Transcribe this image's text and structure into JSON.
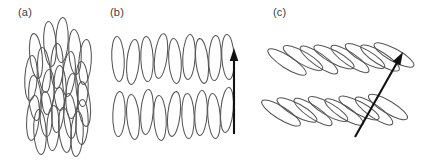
{
  "figure": {
    "background_color": "#ffffff",
    "particle_stroke_color": "#555555",
    "arrow_color": "#111111",
    "label_color": "#3d3d3d",
    "width": 423,
    "height": 161
  },
  "panels": [
    {
      "id": "panel-a",
      "label": "(a)",
      "label_x": 18,
      "label_y": 16,
      "phase": "nematic",
      "has_director_arrow": false,
      "particle_count": 24,
      "description": "Randomly positioned elongated particles with roughly aligned long axes and no layer ordering"
    },
    {
      "id": "panel-b",
      "label": "(b)",
      "label_x": 110,
      "label_y": 16,
      "phase": "smectic-A",
      "has_director_arrow": true,
      "particle_count": 18,
      "description": "Two layers of elongated particles with long axes parallel to the layer normal"
    },
    {
      "id": "panel-c",
      "label": "(c)",
      "label_x": 273,
      "label_y": 16,
      "phase": "smectic-C",
      "has_director_arrow": true,
      "particle_count": 16,
      "description": "Two layers of elongated particles with long axes tilted with respect to the layer normal"
    }
  ],
  "chart_data": {
    "type": "diagram",
    "title": "",
    "xlabel": "",
    "ylabel": "",
    "ellipse_rx": 6.2,
    "ellipse_ry": 22.5,
    "panel_a_particles": [
      {
        "cx": 36,
        "cy": 56,
        "rot": -6
      },
      {
        "cx": 50,
        "cy": 44,
        "rot": -4
      },
      {
        "cx": 62,
        "cy": 40,
        "rot": 2
      },
      {
        "cx": 75,
        "cy": 52,
        "rot": -3
      },
      {
        "cx": 85,
        "cy": 62,
        "rot": 4
      },
      {
        "cx": 31,
        "cy": 78,
        "rot": 3
      },
      {
        "cx": 44,
        "cy": 70,
        "rot": -5
      },
      {
        "cx": 57,
        "cy": 66,
        "rot": 1
      },
      {
        "cx": 69,
        "cy": 74,
        "rot": 5
      },
      {
        "cx": 82,
        "cy": 84,
        "rot": -2
      },
      {
        "cx": 35,
        "cy": 98,
        "rot": -4
      },
      {
        "cx": 48,
        "cy": 92,
        "rot": 3
      },
      {
        "cx": 60,
        "cy": 88,
        "rot": -1
      },
      {
        "cx": 72,
        "cy": 96,
        "rot": 2
      },
      {
        "cx": 84,
        "cy": 104,
        "rot": -6
      },
      {
        "cx": 33,
        "cy": 118,
        "rot": 5
      },
      {
        "cx": 46,
        "cy": 114,
        "rot": -2
      },
      {
        "cx": 58,
        "cy": 110,
        "rot": 4
      },
      {
        "cx": 70,
        "cy": 116,
        "rot": -4
      },
      {
        "cx": 82,
        "cy": 122,
        "rot": 1
      },
      {
        "cx": 40,
        "cy": 132,
        "rot": -3
      },
      {
        "cx": 53,
        "cy": 128,
        "rot": 2
      },
      {
        "cx": 65,
        "cy": 130,
        "rot": -5
      },
      {
        "cx": 77,
        "cy": 134,
        "rot": 3
      }
    ],
    "panel_b_row1": [
      {
        "cx": 118,
        "cy": 59,
        "rot": -3
      },
      {
        "cx": 133,
        "cy": 62,
        "rot": 5
      },
      {
        "cx": 147,
        "cy": 59,
        "rot": -2
      },
      {
        "cx": 161,
        "cy": 56,
        "rot": 7
      },
      {
        "cx": 175,
        "cy": 61,
        "rot": -4
      },
      {
        "cx": 189,
        "cy": 57,
        "rot": 3
      },
      {
        "cx": 202,
        "cy": 61,
        "rot": -6
      },
      {
        "cx": 215,
        "cy": 58,
        "rot": 2
      },
      {
        "cx": 228,
        "cy": 57,
        "rot": -3
      }
    ],
    "panel_b_row2": [
      {
        "cx": 119,
        "cy": 114,
        "rot": 2
      },
      {
        "cx": 133,
        "cy": 117,
        "rot": -5
      },
      {
        "cx": 147,
        "cy": 112,
        "rot": 4
      },
      {
        "cx": 160,
        "cy": 118,
        "rot": -3
      },
      {
        "cx": 174,
        "cy": 114,
        "rot": 6
      },
      {
        "cx": 188,
        "cy": 116,
        "rot": -2
      },
      {
        "cx": 201,
        "cy": 113,
        "rot": 3
      },
      {
        "cx": 214,
        "cy": 116,
        "rot": -4
      },
      {
        "cx": 227,
        "cy": 110,
        "rot": 5
      }
    ],
    "panel_c_row1": [
      {
        "cx": 287,
        "cy": 62,
        "rot": -57
      },
      {
        "cx": 303,
        "cy": 58,
        "rot": -60
      },
      {
        "cx": 319,
        "cy": 60,
        "rot": -55
      },
      {
        "cx": 334,
        "cy": 57,
        "rot": -62
      },
      {
        "cx": 350,
        "cy": 59,
        "rot": -56
      },
      {
        "cx": 365,
        "cy": 56,
        "rot": -60
      },
      {
        "cx": 380,
        "cy": 58,
        "rot": -58
      },
      {
        "cx": 394,
        "cy": 55,
        "rot": -61
      }
    ],
    "panel_c_row2": [
      {
        "cx": 281,
        "cy": 113,
        "rot": -58
      },
      {
        "cx": 297,
        "cy": 110,
        "rot": -61
      },
      {
        "cx": 313,
        "cy": 112,
        "rot": -56
      },
      {
        "cx": 328,
        "cy": 109,
        "rot": -60
      },
      {
        "cx": 344,
        "cy": 112,
        "rot": -57
      },
      {
        "cx": 359,
        "cy": 108,
        "rot": -62
      },
      {
        "cx": 374,
        "cy": 111,
        "rot": -55
      },
      {
        "cx": 388,
        "cy": 107,
        "rot": -59
      }
    ],
    "panel_b_arrow": {
      "x1": 234,
      "y1": 134,
      "x2": 234,
      "y2": 48,
      "angle_deg": 90
    },
    "panel_c_arrow": {
      "x1": 355,
      "y1": 137,
      "x2": 403,
      "y2": 52,
      "angle_deg": 60
    }
  }
}
